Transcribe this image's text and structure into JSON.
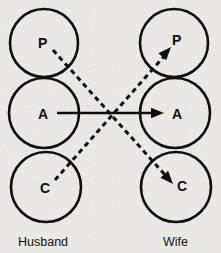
{
  "diagram": {
    "type": "transactional-analysis-ego-state-diagram",
    "background_color": "#e9e8e4",
    "ink_color": "#110f0d",
    "parties": [
      {
        "id": "husband",
        "label": "Husband",
        "label_x": 18,
        "label_y": 246,
        "column_center_x": 44,
        "ego_states": [
          {
            "id": "husband-parent",
            "letter": "P",
            "cx": 44,
            "cy": 43,
            "r": 34,
            "letter_x": 38,
            "letter_y": 48
          },
          {
            "id": "husband-adult",
            "letter": "A",
            "cx": 44,
            "cy": 113,
            "r": 35,
            "letter_x": 38,
            "letter_y": 119
          },
          {
            "id": "husband-child",
            "letter": "C",
            "cx": 46,
            "cy": 187,
            "r": 35,
            "letter_x": 40,
            "letter_y": 193
          }
        ]
      },
      {
        "id": "wife",
        "label": "Wife",
        "label_x": 163,
        "label_y": 246,
        "column_center_x": 175,
        "ego_states": [
          {
            "id": "wife-parent",
            "letter": "P",
            "cx": 174,
            "cy": 43,
            "r": 34,
            "letter_x": 172,
            "letter_y": 45
          },
          {
            "id": "wife-adult",
            "letter": "A",
            "cx": 175,
            "cy": 113,
            "r": 35,
            "letter_x": 172,
            "letter_y": 119
          },
          {
            "id": "wife-child",
            "letter": "C",
            "cx": 176,
            "cy": 187,
            "r": 35,
            "letter_x": 177,
            "letter_y": 191
          }
        ]
      }
    ],
    "vectors": [
      {
        "id": "adult-to-adult",
        "style": "solid",
        "from": "husband-adult",
        "to": "wife-adult",
        "x1": 57,
        "y1": 113,
        "x2": 156,
        "y2": 113,
        "arrow_tip_x": 164,
        "arrow_tip_y": 113,
        "arrow_angle_deg": 0
      },
      {
        "id": "parent-to-child",
        "style": "dashed",
        "from": "husband-parent",
        "to": "wife-child",
        "x1": 53,
        "y1": 50,
        "x2": 166,
        "y2": 176,
        "arrow_tip_x": 173,
        "arrow_tip_y": 184,
        "arrow_angle_deg": 48
      },
      {
        "id": "child-to-parent",
        "style": "dashed",
        "from": "husband-child",
        "to": "wife-parent",
        "x1": 55,
        "y1": 180,
        "x2": 166,
        "y2": 54,
        "arrow_tip_x": 171,
        "arrow_tip_y": 47,
        "arrow_angle_deg": -48
      }
    ],
    "crossing_point": {
      "x": 112,
      "y": 113
    }
  }
}
